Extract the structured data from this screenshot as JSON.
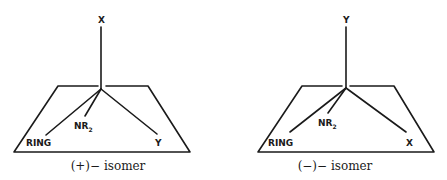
{
  "figure": {
    "panels": [
      {
        "id": "plus-isomer",
        "caption": "(+)− isomer",
        "top_substituent": "X",
        "ring_label": "RING",
        "amine_label": "NR",
        "amine_subscript": "2",
        "right_substituent": "Y"
      },
      {
        "id": "minus-isomer",
        "caption": "(−)− isomer",
        "top_substituent": "Y",
        "ring_label": "RING",
        "amine_label": "NR",
        "amine_subscript": "2",
        "right_substituent": "X"
      }
    ],
    "colors": {
      "ink": "#1a1a1a",
      "background": "#ffffff"
    }
  }
}
